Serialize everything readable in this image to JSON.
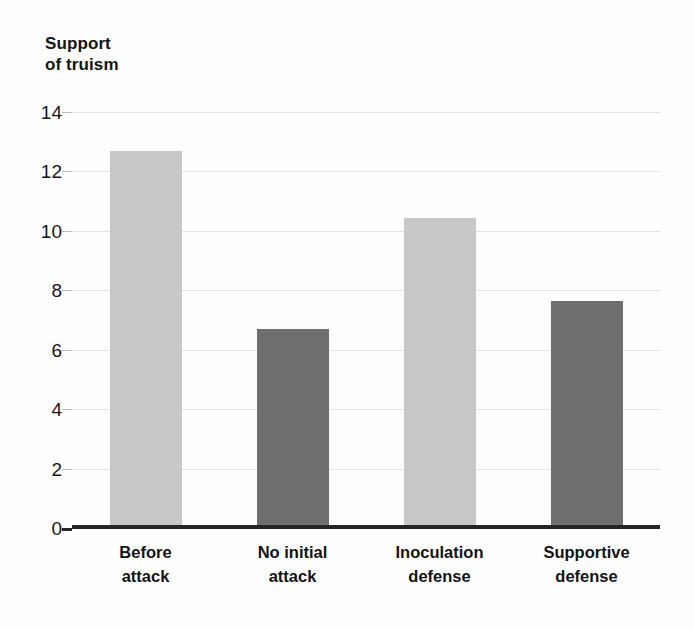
{
  "figure": {
    "axis_title": "Support\nof truism",
    "background_color": "#fefefe",
    "axis_color": "#262626",
    "grid_color": "#e3e3e3"
  },
  "chart_data": {
    "type": "bar",
    "title": "",
    "subtitle": "",
    "xlabel": "",
    "ylabel": "Support of truism",
    "categories": [
      "Before\nattack",
      "No initial\nattack",
      "Inoculation\ndefense",
      "Supportive\ndefense"
    ],
    "values": [
      12.7,
      6.7,
      10.45,
      7.65
    ],
    "series": [
      {
        "name": "Support of truism",
        "values": [
          12.7,
          6.7,
          10.45,
          7.65
        ]
      }
    ],
    "bar_colors": [
      "#c8c8c8",
      "#6e6e6e",
      "#c8c8c8",
      "#6e6e6e"
    ],
    "ylim": [
      0,
      14
    ],
    "ytick_labels": [
      "0",
      "2",
      "4",
      "6",
      "8",
      "10",
      "12",
      "14"
    ],
    "ytick_values": [
      0,
      2,
      4,
      6,
      8,
      10,
      12,
      14
    ],
    "grid": true,
    "grid_axis": "y",
    "legend": false,
    "legend_position": "none",
    "annotations": []
  }
}
